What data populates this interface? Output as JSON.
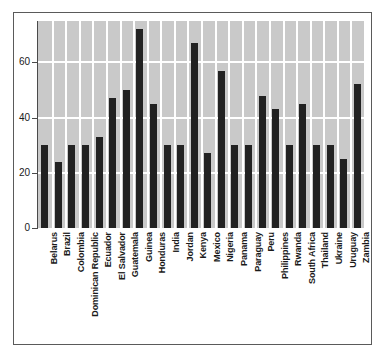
{
  "chart_data": {
    "type": "bar",
    "title": "",
    "subtitle": "",
    "xlabel": "",
    "ylabel": "",
    "ylim": [
      0,
      75
    ],
    "yticks": [
      0,
      20,
      40,
      60
    ],
    "ytick_labels": [
      "0",
      "20",
      "40",
      "60"
    ],
    "grid": true,
    "grid_color": "#ffffff",
    "plot_background": "#c9c9c9",
    "bar_color": "#222222",
    "legend": "none",
    "categories": [
      "Belarus",
      "Brazil",
      "Colombia",
      "Dominican Republic",
      "Ecuador",
      "El Salvador",
      "Guatemala",
      "Guinea",
      "Honduras",
      "India",
      "Jordan",
      "Kenya",
      "Mexico",
      "Nigeria",
      "Panama",
      "Paraguay",
      "Peru",
      "Philippines",
      "Rwanda",
      "South Africa",
      "Thailand",
      "Ukraine",
      "Uruguay",
      "Zambia"
    ],
    "values": [
      30,
      24,
      30,
      30,
      33,
      47,
      50,
      72,
      45,
      30,
      30,
      67,
      27,
      57,
      30,
      30,
      48,
      43,
      30,
      45,
      30,
      30,
      25,
      52
    ]
  }
}
